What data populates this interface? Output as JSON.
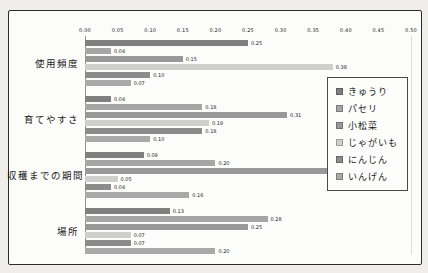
{
  "page": {
    "background": "#f0eeea",
    "paper": "#fcfcfa",
    "frame_border": "#2b2b2b"
  },
  "chart_data": {
    "type": "bar",
    "orientation": "horizontal",
    "title": "",
    "xlabel": "",
    "ylabel": "",
    "categories": [
      "使用頻度",
      "育てやすさ",
      "収穫までの期間",
      "場所"
    ],
    "series": [
      {
        "name": "きゅうり",
        "color": "#7f7f7f",
        "values": [
          0.25,
          0.04,
          0.09,
          0.13
        ]
      },
      {
        "name": "パセリ",
        "color": "#a6a6a6",
        "values": [
          0.04,
          0.18,
          0.2,
          0.28
        ]
      },
      {
        "name": "小松菜",
        "color": "#999999",
        "values": [
          0.15,
          0.31,
          0.46,
          0.25
        ]
      },
      {
        "name": "じゃがいも",
        "color": "#cfcfce",
        "values": [
          0.38,
          0.19,
          0.05,
          0.07
        ]
      },
      {
        "name": "にんじん",
        "color": "#8c8c8c",
        "values": [
          0.1,
          0.18,
          0.04,
          0.16
        ]
      },
      {
        "name": "いんげん",
        "color": "#a9a9a9",
        "values": [
          0.07,
          0.1,
          0.16,
          0.2
        ]
      }
    ],
    "series_note": "values are ordered by category: 使用頻度, 育てやすさ, 収穫までの期間, 場所",
    "corrections": {
      "にんじん": [
        0.1,
        0.18,
        0.04,
        0.07
      ],
      "いんげん": [
        0.07,
        0.1,
        0.16,
        0.2
      ]
    },
    "xlim": [
      0.0,
      0.5
    ],
    "x_tick_labels": [
      "0.00",
      "0.05",
      "0.10",
      "0.15",
      "0.20",
      "0.25",
      "0.30",
      "0.35",
      "0.40",
      "0.45",
      "0.50"
    ],
    "x_tick_position": "top",
    "grid": "off",
    "value_labels": "two-decimal labels at end of each bar",
    "legend": {
      "position": "middle-right",
      "border": true,
      "items": [
        "きゅうり",
        "パセリ",
        "小松菜",
        "じゃがいも",
        "にんじん",
        "いんげん"
      ]
    }
  }
}
